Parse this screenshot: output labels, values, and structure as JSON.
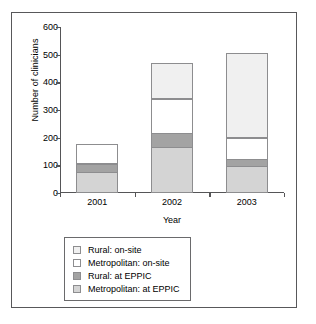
{
  "chart_data": {
    "type": "bar",
    "stacked": true,
    "title": "",
    "xlabel": "Year",
    "ylabel": "Number of clinicians",
    "categories": [
      "2001",
      "2002",
      "2003"
    ],
    "ylim": [
      0,
      600
    ],
    "yticks": [
      0,
      100,
      200,
      300,
      400,
      500,
      600
    ],
    "ytick_labels": [
      "0",
      "100",
      "200",
      "300",
      "400",
      "500",
      "600"
    ],
    "grid": false,
    "legend_position": "below-plot",
    "series": [
      {
        "name": "Metropolitan: at EPPIC",
        "color": "#d4d4d4",
        "values": [
          75,
          165,
          95
        ]
      },
      {
        "name": "Rural: at EPPIC",
        "color": "#a3a3a3",
        "values": [
          33,
          53,
          30
        ]
      },
      {
        "name": "Metropolitan: on-site",
        "color": "#ffffff",
        "values": [
          69,
          125,
          80
        ]
      },
      {
        "name": "Rural: on-site",
        "color": "#f0f0f0",
        "values": [
          0,
          130,
          305
        ]
      }
    ],
    "stack_totals": [
      177,
      473,
      510
    ],
    "legend_order_top_to_bottom": [
      "Rural: on-site",
      "Metropolitan: on-site",
      "Rural: at EPPIC",
      "Metropolitan: at EPPIC"
    ]
  },
  "legend": {
    "items": [
      {
        "label": "Rural: on-site",
        "swatch_color": "#f0f0f0"
      },
      {
        "label": "Metropolitan: on-site",
        "swatch_color": "#ffffff"
      },
      {
        "label": "Rural: at EPPIC",
        "swatch_color": "#a3a3a3"
      },
      {
        "label": "Metropolitan: at EPPIC",
        "swatch_color": "#d4d4d4"
      }
    ]
  },
  "axes": {
    "y_title": "Number of clinicians",
    "x_title": "Year"
  },
  "frame": {
    "border_color": "#58585a",
    "background": "#ffffff"
  }
}
